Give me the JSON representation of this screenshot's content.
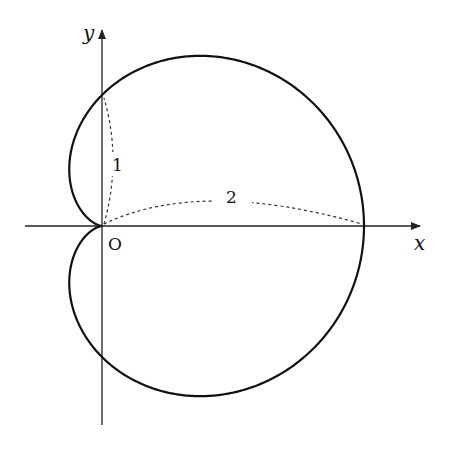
{
  "figure": {
    "curve_equation": "r = 1 + cos θ",
    "axes": {
      "x_label": "x",
      "y_label": "y",
      "origin_label": "O"
    },
    "annotations": [
      {
        "label": "1",
        "meaning": "distance from O to y-intercept (0,1)"
      },
      {
        "label": "2",
        "meaning": "distance from O to x-intercept (2,0)"
      }
    ],
    "colors": {
      "curve": "#111111",
      "axes": "#222222",
      "dashed": "#333333",
      "background": "#ffffff"
    }
  }
}
